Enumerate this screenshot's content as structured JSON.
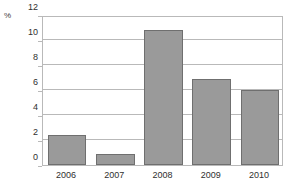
{
  "chart_data": {
    "type": "bar",
    "title": "",
    "xlabel": "",
    "ylabel": "%",
    "unit_label": "%",
    "categories": [
      "2006",
      "2007",
      "2008",
      "2009",
      "2010"
    ],
    "values": [
      2.4,
      0.9,
      10.8,
      6.9,
      6.0
    ],
    "ylim": [
      0,
      12
    ],
    "yticks": [
      0,
      2,
      4,
      6,
      8,
      10,
      12
    ],
    "ytick_labels": [
      "0",
      "2",
      "4",
      "6",
      "8",
      "10",
      "12"
    ],
    "grid": true,
    "grid_axis": "y",
    "legend": false,
    "legend_position": "none",
    "series": [
      {
        "name": "",
        "values": [
          2.4,
          0.9,
          10.8,
          6.9,
          6.0
        ]
      }
    ],
    "colors": {
      "bar_fill": "#9a9a9a",
      "bar_border": "#6f6f6f",
      "gridline": "#b9b9b9",
      "frame": "#b9b9b9",
      "text": "#2f2f2f",
      "background": "#ffffff"
    }
  }
}
